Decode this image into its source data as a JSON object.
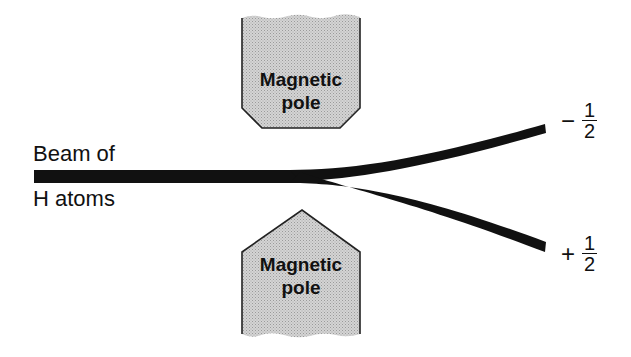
{
  "diagram": {
    "beam": {
      "label_line1": "Beam of",
      "label_line2": "H atoms",
      "color": "#111111"
    },
    "poles": {
      "top": {
        "label_line1": "Magnetic",
        "label_line2": "pole",
        "shape": "flat-chamfered",
        "fill": "#c8c8c8"
      },
      "bottom": {
        "label_line1": "Magnetic",
        "label_line2": "pole",
        "shape": "pointed",
        "fill": "#c8c8c8"
      }
    },
    "outputs": {
      "upper": {
        "sign": "−",
        "numerator": "1",
        "denominator": "2"
      },
      "lower": {
        "sign": "+",
        "numerator": "1",
        "denominator": "2"
      }
    }
  }
}
